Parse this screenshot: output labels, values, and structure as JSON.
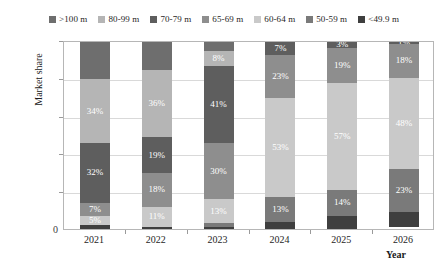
{
  "chart_data": {
    "type": "bar",
    "subtype": "stacked-percentage",
    "title": "",
    "xlabel": "Year",
    "ylabel": "Market share",
    "categories": [
      "2021",
      "2022",
      "2023",
      "2024",
      "2025",
      "2026"
    ],
    "ylim": [
      0,
      100
    ],
    "ytick_labels": [
      "0",
      "20%",
      "40%",
      "60%",
      "80%",
      "100%"
    ],
    "ytick_values": [
      0,
      20,
      40,
      60,
      80,
      100
    ],
    "grid": true,
    "legend_position": "top",
    "stack_order": "bottom-to-top",
    "series": [
      {
        "name": "<49.9 m",
        "color": "#3f3f3f",
        "values": [
          2,
          1,
          1,
          4,
          7,
          8
        ],
        "labels": [
          "",
          "",
          "",
          "",
          "",
          ""
        ]
      },
      {
        "name": "50-59 m",
        "color": "#7a7a7a",
        "values": [
          0,
          0,
          2,
          13,
          14,
          23
        ],
        "labels": [
          "",
          "",
          "",
          "13%",
          "14%",
          "23%"
        ]
      },
      {
        "name": "60-64 m",
        "color": "#c9c9c9",
        "values": [
          5,
          11,
          13,
          53,
          57,
          48
        ],
        "labels": [
          "5%",
          "11%",
          "13%",
          "53%",
          "57%",
          "48%"
        ]
      },
      {
        "name": "65-69 m",
        "color": "#8e8e8e",
        "values": [
          7,
          18,
          30,
          23,
          19,
          18
        ],
        "labels": [
          "7%",
          "18%",
          "30%",
          "23%",
          "19%",
          "18%"
        ]
      },
      {
        "name": "70-79 m",
        "color": "#5e5e5e",
        "values": [
          32,
          19,
          41,
          7,
          3,
          1
        ],
        "labels": [
          "32%",
          "19%",
          "41%",
          "7%",
          "3%",
          "1%"
        ]
      },
      {
        "name": "80-99 m",
        "color": "#b5b5b5",
        "values": [
          34,
          36,
          8,
          0,
          0,
          0
        ],
        "labels": [
          "34%",
          "36%",
          "8%",
          "",
          "",
          ""
        ]
      },
      {
        "name": ">100 m",
        "color": "#6e6e6e",
        "values": [
          20,
          15,
          5,
          0,
          0,
          0
        ],
        "labels": [
          "",
          "",
          "",
          "",
          "",
          ""
        ]
      }
    ]
  },
  "legend": {
    "items": [
      {
        "label": ">100 m",
        "color": "#6e6e6e"
      },
      {
        "label": "80-99 m",
        "color": "#b5b5b5"
      },
      {
        "label": "70-79 m",
        "color": "#5e5e5e"
      },
      {
        "label": "65-69 m",
        "color": "#8e8e8e"
      },
      {
        "label": "60-64 m",
        "color": "#c9c9c9"
      },
      {
        "label": "50-59 m",
        "color": "#7a7a7a"
      },
      {
        "label": "<49.9 m",
        "color": "#3f3f3f"
      }
    ]
  },
  "axes": {
    "y_title": "Market share",
    "x_title": "Year",
    "zero_label": "0"
  }
}
